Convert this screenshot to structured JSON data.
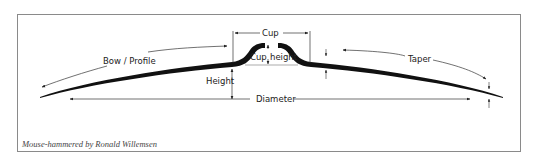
{
  "diagram": {
    "labels": {
      "cup": "Cup",
      "cup_height": "Cup height",
      "cup_height_left": "Cup",
      "cup_height_right": "height",
      "bow_profile": "Bow / Profile",
      "height": "Height",
      "diameter": "Diameter",
      "taper": "Taper"
    },
    "credit": "Mouse-hammered by Ronald Willemsen",
    "colors": {
      "stroke": "#111111",
      "frame": "#8a8a8a",
      "annotation": "#333333"
    }
  }
}
